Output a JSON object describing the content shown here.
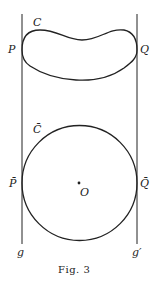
{
  "figure": {
    "caption": "Fig. 3",
    "colors": {
      "ink": "#222222",
      "background": "#ffffff"
    },
    "lines": [
      {
        "name": "g",
        "label": "g"
      },
      {
        "name": "g-prime",
        "label": "g′"
      }
    ],
    "top_curve": {
      "label": "C",
      "left_point": "P",
      "right_point": "Q"
    },
    "circle": {
      "label": "C̄",
      "left_point": "P̄",
      "right_point": "Q̄",
      "center": "O"
    }
  }
}
